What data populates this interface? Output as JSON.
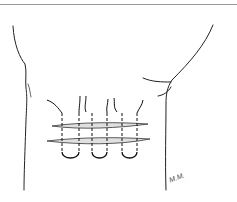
{
  "figure": {
    "signature": "M.M."
  }
}
